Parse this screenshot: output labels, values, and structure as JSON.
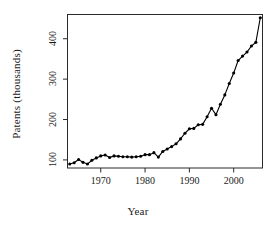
{
  "chart_data": {
    "type": "line",
    "title": "",
    "subtitle": "",
    "xlabel": "Year",
    "ylabel": "Patents (thousands)",
    "xlim": [
      1962.5,
      2006.5
    ],
    "ylim": [
      80,
      460
    ],
    "xticks": [
      1970,
      1980,
      1990,
      2000
    ],
    "xticklabels": [
      "1970",
      "1980",
      "1990",
      "2000"
    ],
    "yticks": [
      100,
      200,
      300,
      400
    ],
    "yticklabels": [
      "100",
      "200",
      "300",
      "400"
    ],
    "grid": false,
    "legend": null,
    "marker": "filled-circle",
    "line_color": "#000000",
    "marker_color": "#000000",
    "x": [
      1963,
      1964,
      1965,
      1966,
      1967,
      1968,
      1969,
      1970,
      1971,
      1972,
      1973,
      1974,
      1975,
      1976,
      1977,
      1978,
      1979,
      1980,
      1981,
      1982,
      1983,
      1984,
      1985,
      1986,
      1987,
      1988,
      1989,
      1990,
      1991,
      1992,
      1993,
      1994,
      1995,
      1996,
      1997,
      1998,
      1999,
      2000,
      2001,
      2002,
      2003,
      2004,
      2005,
      2006
    ],
    "values": [
      90,
      93,
      101,
      94,
      90,
      99,
      105,
      110,
      112,
      106,
      110,
      109,
      108,
      108,
      107,
      108,
      109,
      113,
      113,
      118,
      107,
      121,
      127,
      133,
      140,
      152,
      166,
      177,
      178,
      187,
      188,
      207,
      228,
      212,
      238,
      261,
      289,
      315,
      346,
      357,
      367,
      382,
      391,
      452
    ],
    "annotations": []
  }
}
